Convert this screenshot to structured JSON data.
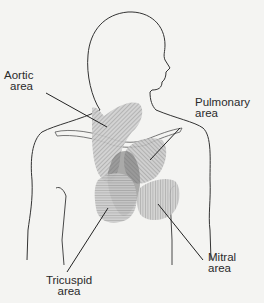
{
  "diagram": {
    "labels": {
      "aortic": {
        "line1": "Aortic",
        "line2": "area"
      },
      "pulmonary": {
        "line1": "Pulmonary",
        "line2": "area"
      },
      "tricuspid": {
        "line1": "Tricuspid",
        "line2": "area"
      },
      "mitral": {
        "line1": "Mitral",
        "line2": "area"
      }
    },
    "colors": {
      "background": "#f4f4f2",
      "outline": "#333333",
      "hatch": "#8a8a8a",
      "shade": "#c8c8c8"
    }
  }
}
